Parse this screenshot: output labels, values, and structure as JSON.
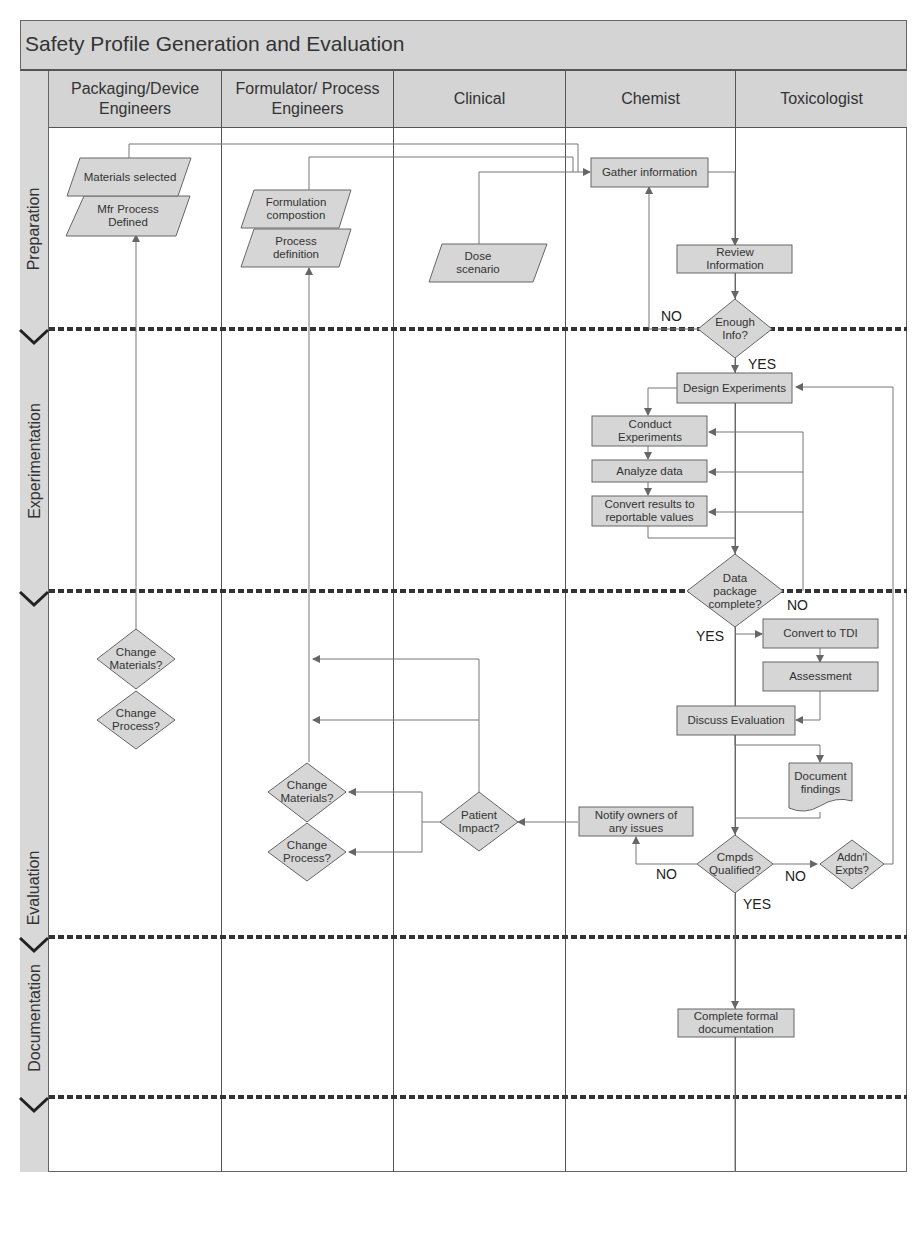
{
  "title": "Safety Profile Generation and Evaluation",
  "lanes": [
    {
      "label": "Packaging/Device Engineers"
    },
    {
      "label": "Formulator/ Process Engineers"
    },
    {
      "label": "Clinical"
    },
    {
      "label": "Chemist"
    },
    {
      "label": "Toxicologist"
    }
  ],
  "phases": [
    {
      "label": "Preparation"
    },
    {
      "label": "Experimentation"
    },
    {
      "label": "Evaluation"
    },
    {
      "label": "Documentation"
    }
  ],
  "nodes": {
    "materials_selected": "Materials selected",
    "mfr_process_defined": "Mfr Process Defined",
    "formulation_composition": "Formulation compostion",
    "process_definition": "Process definition",
    "dose_scenario": "Dose scenario",
    "gather_information": "Gather information",
    "review_information": "Review Information",
    "enough_info": "Enough Info?",
    "design_experiments": "Design Experiments",
    "conduct_experiments": "Conduct Experiments",
    "analyze_data": "Analyze data",
    "convert_results": "Convert results to reportable values",
    "data_package_complete": "Data package complete?",
    "convert_to_tdi": "Convert to TDI",
    "assessment": "Assessment",
    "discuss_evaluation": "Discuss Evaluation",
    "document_findings": "Document findings",
    "notify_owners": "Notify owners of any issues",
    "patient_impact": "Patient Impact?",
    "change_materials_pkg": "Change Materials?",
    "change_process_pkg": "Change Process?",
    "change_materials_form": "Change Materials?",
    "change_process_form": "Change Process?",
    "cmpds_qualified": "Cmpds Qualified?",
    "addnl_expts": "Addn'l Expts?",
    "complete_documentation": "Complete formal documentation"
  },
  "edge_labels": {
    "enough_no": "NO",
    "enough_yes": "YES",
    "data_no": "NO",
    "data_yes": "YES",
    "cmpds_no_left": "NO",
    "cmpds_no_right": "NO",
    "cmpds_yes": "YES"
  },
  "colors": {
    "shape_fill": "#d6d6d6",
    "header_fill": "#d4d4d4",
    "line": "#777777",
    "divider": "#333333"
  }
}
